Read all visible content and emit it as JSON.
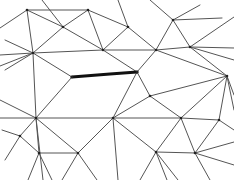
{
  "diagram": {
    "type": "triangular-mesh",
    "colors": {
      "background": "#ffffff",
      "edge": "#555555",
      "highlight_edge": "#111111",
      "vertex": "#222222"
    },
    "vertices": {
      "A": [
        27,
        10
      ],
      "B": [
        88,
        10
      ],
      "C": [
        63,
        27
      ],
      "D": [
        33,
        53
      ],
      "E": [
        103,
        50
      ],
      "F": [
        128,
        27
      ],
      "G": [
        173,
        20
      ],
      "H": [
        156,
        50
      ],
      "I": [
        190,
        47
      ],
      "J": [
        137,
        72
      ],
      "K": [
        227,
        76
      ],
      "L": [
        72,
        77
      ],
      "M": [
        36,
        118
      ],
      "N": [
        113,
        118
      ],
      "O": [
        181,
        118
      ],
      "P": [
        219,
        120
      ],
      "Q": [
        20,
        136
      ],
      "R": [
        39,
        153
      ],
      "S": [
        78,
        153
      ],
      "T": [
        156,
        152
      ],
      "U": [
        195,
        153
      ],
      "W": [
        150,
        96
      ]
    },
    "edges": [
      [
        "A",
        "B"
      ],
      [
        "A",
        "C"
      ],
      [
        "C",
        "E"
      ],
      [
        "A",
        "D"
      ],
      [
        "B",
        "C"
      ],
      [
        "C",
        "D"
      ],
      [
        "B",
        "F"
      ],
      [
        "B",
        "E"
      ],
      [
        "D",
        "E"
      ],
      [
        "E",
        "J"
      ],
      [
        "E",
        "H"
      ],
      [
        "F",
        "H"
      ],
      [
        "F",
        "E"
      ],
      [
        "G",
        "H"
      ],
      [
        "G",
        "I"
      ],
      [
        "H",
        "I"
      ],
      [
        "H",
        "J"
      ],
      [
        "I",
        "K"
      ],
      [
        "H",
        "K"
      ],
      [
        "J",
        "W"
      ],
      [
        "W",
        "K"
      ],
      [
        "W",
        "N"
      ],
      [
        "D",
        "L"
      ],
      [
        "D",
        "M"
      ],
      [
        "L",
        "M"
      ],
      [
        "L",
        "J"
      ],
      [
        "J",
        "N"
      ],
      [
        "M",
        "N"
      ],
      [
        "N",
        "O"
      ],
      [
        "O",
        "K"
      ],
      [
        "K",
        "P"
      ],
      [
        "O",
        "P"
      ],
      [
        "W",
        "O"
      ],
      [
        "M",
        "Q"
      ],
      [
        "M",
        "R"
      ],
      [
        "Q",
        "R"
      ],
      [
        "M",
        "S"
      ],
      [
        "R",
        "S"
      ],
      [
        "N",
        "S"
      ],
      [
        "N",
        "T"
      ],
      [
        "O",
        "T"
      ],
      [
        "O",
        "U"
      ],
      [
        "T",
        "U"
      ],
      [
        "P",
        "U"
      ]
    ],
    "boundary_edges": [
      [
        [
          0,
          28
        ],
        [
          27,
          10
        ]
      ],
      [
        [
          0,
          55
        ],
        [
          33,
          53
        ]
      ],
      [
        [
          0,
          66
        ],
        [
          33,
          53
        ]
      ],
      [
        [
          5,
          40
        ],
        [
          33,
          53
        ]
      ],
      [
        [
          5,
          70
        ],
        [
          33,
          53
        ]
      ],
      [
        [
          42,
          0
        ],
        [
          63,
          27
        ]
      ],
      [
        [
          118,
          0
        ],
        [
          128,
          27
        ]
      ],
      [
        [
          150,
          0
        ],
        [
          173,
          20
        ]
      ],
      [
        [
          200,
          5
        ],
        [
          173,
          20
        ]
      ],
      [
        [
          222,
          18
        ],
        [
          173,
          20
        ]
      ],
      [
        [
          234,
          17
        ],
        [
          190,
          47
        ]
      ],
      [
        [
          234,
          48
        ],
        [
          190,
          47
        ]
      ],
      [
        [
          234,
          60
        ],
        [
          190,
          47
        ]
      ],
      [
        [
          234,
          110
        ],
        [
          227,
          76
        ]
      ],
      [
        [
          234,
          95
        ],
        [
          227,
          76
        ]
      ],
      [
        [
          234,
          130
        ],
        [
          219,
          120
        ]
      ],
      [
        [
          234,
          142
        ],
        [
          195,
          153
        ]
      ],
      [
        [
          234,
          165
        ],
        [
          195,
          153
        ]
      ],
      [
        [
          0,
          118
        ],
        [
          36,
          118
        ]
      ],
      [
        [
          0,
          100
        ],
        [
          36,
          118
        ]
      ],
      [
        [
          5,
          160
        ],
        [
          20,
          136
        ]
      ],
      [
        [
          2,
          130
        ],
        [
          20,
          136
        ]
      ],
      [
        [
          28,
          180
        ],
        [
          39,
          153
        ]
      ],
      [
        [
          52,
          180
        ],
        [
          39,
          153
        ]
      ],
      [
        [
          43,
          180
        ],
        [
          36,
          118
        ]
      ],
      [
        [
          62,
          180
        ],
        [
          78,
          153
        ]
      ],
      [
        [
          97,
          180
        ],
        [
          78,
          153
        ]
      ],
      [
        [
          118,
          180
        ],
        [
          113,
          118
        ]
      ],
      [
        [
          140,
          180
        ],
        [
          156,
          152
        ]
      ],
      [
        [
          178,
          180
        ],
        [
          156,
          152
        ]
      ],
      [
        [
          210,
          180
        ],
        [
          195,
          153
        ]
      ],
      [
        [
          167,
          180
        ],
        [
          156,
          152
        ]
      ]
    ],
    "highlighted_edge": [
      [
        72,
        77
      ],
      [
        110,
        74
      ],
      [
        137,
        72
      ]
    ]
  }
}
